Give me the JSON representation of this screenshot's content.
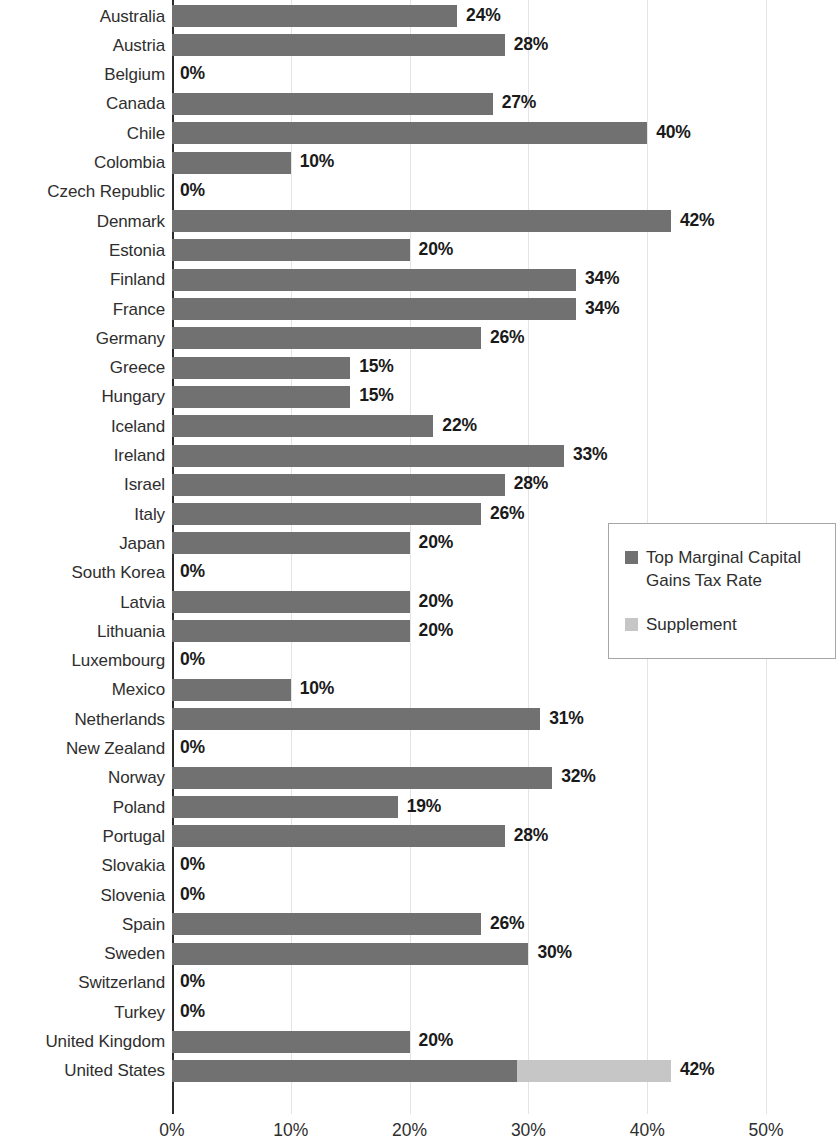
{
  "chart_data": {
    "type": "bar",
    "orientation": "horizontal",
    "title": "",
    "subtitle": "",
    "xlabel": "",
    "ylabel": "",
    "xlim": [
      0,
      50
    ],
    "x_ticks": [
      "0%",
      "10%",
      "20%",
      "30%",
      "40%",
      "50%"
    ],
    "x_tick_values": [
      0,
      10,
      20,
      30,
      40,
      50
    ],
    "grid": true,
    "grid_axis": "x",
    "legend_position": "right-middle",
    "stacked": true,
    "colors": {
      "main": "#717171",
      "supplement": "#c6c6c6",
      "gridline": "#e4e4e4",
      "axis": "#2b2b2b",
      "text": "#2e2e2e",
      "value_label": "#1a1a1a"
    },
    "series": [
      {
        "name": "Top Marginal Capital Gains Tax Rate",
        "color": "#717171"
      },
      {
        "name": "Supplement",
        "color": "#c6c6c6"
      }
    ],
    "categories": [
      "Australia",
      "Austria",
      "Belgium",
      "Canada",
      "Chile",
      "Colombia",
      "Czech Republic",
      "Denmark",
      "Estonia",
      "Finland",
      "France",
      "Germany",
      "Greece",
      "Hungary",
      "Iceland",
      "Ireland",
      "Israel",
      "Italy",
      "Japan",
      "South Korea",
      "Latvia",
      "Lithuania",
      "Luxembourg",
      "Mexico",
      "Netherlands",
      "New Zealand",
      "Norway",
      "Poland",
      "Portugal",
      "Slovakia",
      "Slovenia",
      "Spain",
      "Sweden",
      "Switzerland",
      "Turkey",
      "United Kingdom",
      "United States"
    ],
    "values": [
      24,
      28,
      0,
      27,
      40,
      10,
      0,
      42,
      20,
      34,
      34,
      26,
      15,
      15,
      22,
      33,
      28,
      26,
      20,
      0,
      20,
      20,
      0,
      10,
      31,
      0,
      32,
      19,
      28,
      0,
      0,
      26,
      30,
      0,
      0,
      20,
      42
    ],
    "supplement_values": [
      0,
      0,
      0,
      0,
      0,
      0,
      0,
      0,
      0,
      0,
      0,
      0,
      0,
      0,
      0,
      0,
      0,
      0,
      0,
      0,
      0,
      0,
      0,
      0,
      0,
      0,
      0,
      0,
      0,
      0,
      0,
      0,
      0,
      0,
      0,
      0,
      13
    ],
    "data_labels": [
      "24%",
      "28%",
      "0%",
      "27%",
      "40%",
      "10%",
      "0%",
      "42%",
      "20%",
      "34%",
      "34%",
      "26%",
      "15%",
      "15%",
      "22%",
      "33%",
      "28%",
      "26%",
      "20%",
      "0%",
      "20%",
      "20%",
      "0%",
      "10%",
      "31%",
      "0%",
      "32%",
      "19%",
      "28%",
      "0%",
      "0%",
      "26%",
      "30%",
      "0%",
      "0%",
      "20%",
      "42%"
    ]
  },
  "legend": {
    "items": [
      {
        "label": "Top Marginal Capital Gains Tax Rate",
        "swatch": "main"
      },
      {
        "label": "Supplement",
        "swatch": "supp"
      }
    ]
  }
}
